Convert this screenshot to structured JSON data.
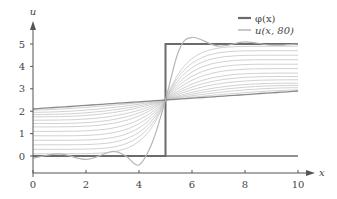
{
  "chart_data": {
    "type": "line",
    "title": "",
    "xlabel": "x",
    "ylabel": "u",
    "xlim": [
      0,
      10
    ],
    "ylim": [
      -0.5,
      5.5
    ],
    "xticks": [
      "0",
      "2",
      "4",
      "6",
      "8",
      "10"
    ],
    "yticks": [
      "0",
      "1",
      "2",
      "3",
      "4",
      "5"
    ],
    "grid": false,
    "legend_position": "top-right",
    "legend": [
      {
        "label": "φ(x)",
        "color": "#6b6b6b"
      },
      {
        "label": "u(x, 80)",
        "color": "#b5b5b5"
      }
    ],
    "series": [
      {
        "name": "φ(x)",
        "description": "step initial condition: 0 for x<5, 5 for x>5",
        "x": [
          0,
          5,
          5,
          10
        ],
        "y": [
          0,
          0,
          5,
          5
        ]
      },
      {
        "name": "u(x, 80)",
        "description": "Fourier partial sum approximation showing Gibbs oscillation around the jump at x=5",
        "x": [
          0,
          1,
          2,
          3,
          3.5,
          4,
          4.5,
          5,
          5.5,
          6,
          7,
          8,
          9,
          10
        ],
        "y": [
          -0.1,
          0.1,
          -0.15,
          0.2,
          0.0,
          -0.4,
          0.6,
          2.5,
          4.7,
          5.3,
          4.9,
          5.1,
          4.95,
          5.0
        ]
      },
      {
        "name": "u(x, t) family",
        "description": "solution curves at increasing times smoothing from step toward linear profile through (5, 2.5); left end rises from 0 to ~2.1, right end falls from 5 to ~3.0",
        "left_end_values": [
          0.1,
          0.3,
          0.5,
          0.7,
          0.9,
          1.1,
          1.3,
          1.45,
          1.6,
          1.75,
          1.85,
          1.95,
          2.05,
          2.1
        ],
        "right_end_values": [
          4.9,
          4.7,
          4.5,
          4.3,
          4.1,
          3.9,
          3.7,
          3.55,
          3.4,
          3.25,
          3.15,
          3.05,
          2.95,
          2.9
        ],
        "center_point": [
          5,
          2.5
        ]
      }
    ]
  }
}
